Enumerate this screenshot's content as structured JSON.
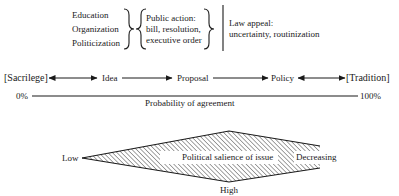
{
  "top_section": {
    "left_list": [
      "Education",
      "Organization",
      "Politicization"
    ],
    "middle_block": [
      "Public action:",
      "bill, resolution,",
      "executive order"
    ],
    "right_block": [
      "Law appeal:",
      "uncertainty, routinization"
    ]
  },
  "stages": {
    "items": [
      "[Sacrilege]",
      "Idea",
      "Proposal",
      "Policy",
      "[Tradition]"
    ],
    "connectors": [
      "bidirectional",
      "forward",
      "forward",
      "bidirectional"
    ]
  },
  "axis": {
    "left_label": "0%",
    "right_label": "100%",
    "title": "Probability of agreement"
  },
  "salience": {
    "center_label": "Political salience of issue",
    "left_label": "Low",
    "bottom_label": "High",
    "right_label": "Decreasing",
    "fill_pattern": "diagonal-hatch",
    "stroke_color": "#1a1a1a"
  }
}
